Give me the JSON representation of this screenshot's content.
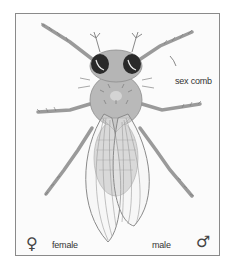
{
  "figure": {
    "annotation": "sex comb",
    "left_symbol": "♀",
    "left_label": "female",
    "right_label": "male",
    "right_symbol": "♂"
  },
  "colors": {
    "frame_border": "#8a8a8a",
    "background": "#fbfbfb",
    "body": "#b9b9b9",
    "body_dark": "#8d8d8d",
    "eye": "#2a2a2a",
    "wing_line": "#8a8a8a",
    "text": "#333333"
  }
}
